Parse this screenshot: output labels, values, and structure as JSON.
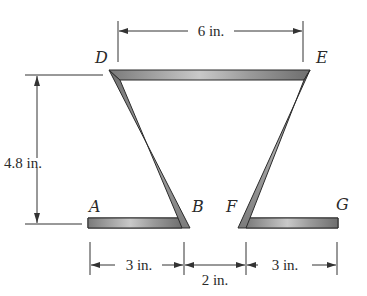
{
  "figure": {
    "points": {
      "A": "A",
      "B": "B",
      "D": "D",
      "E": "E",
      "F": "F",
      "G": "G"
    },
    "dimensions": {
      "top_width": "6 in.",
      "height": "4.8 in.",
      "left_base": "3 in.",
      "gap": "2 in.",
      "right_base": "3 in."
    },
    "colors": {
      "section_fill": "#8a8a8a",
      "section_highlight": "#c8c8c8",
      "section_edge": "#2b2b2b",
      "line": "#333333"
    }
  }
}
